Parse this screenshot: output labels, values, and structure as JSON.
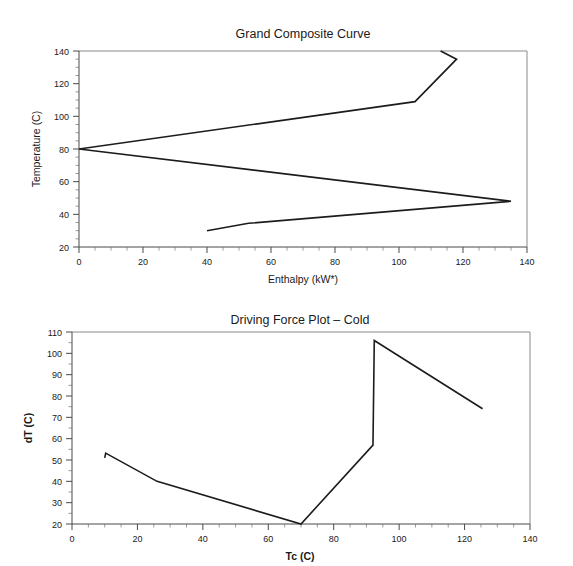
{
  "document": {
    "background_color": "#ffffff",
    "line_color": "#1c1c1c",
    "axis_color": "#4a4a4a",
    "text_color": "#1a1a1a"
  },
  "charts": [
    {
      "id": "grand-composite-curve",
      "title": "Grand Composite Curve",
      "xlabel": "Enthalpy (kW*)",
      "ylabel": "Temperature (C)",
      "xlabel_bold": false,
      "ylabel_bold": false,
      "xticks": [
        "0",
        "20",
        "40",
        "60",
        "80",
        "100",
        "120",
        "140"
      ],
      "yticks": [
        "20",
        "40",
        "60",
        "80",
        "100",
        "120",
        "140"
      ]
    },
    {
      "id": "driving-force-plot-cold",
      "title": "Driving Force Plot – Cold",
      "xlabel": "Tc (C)",
      "ylabel": "dT (C)",
      "xlabel_bold": true,
      "ylabel_bold": true,
      "xticks": [
        "0",
        "20",
        "40",
        "60",
        "80",
        "100",
        "120",
        "140"
      ],
      "yticks": [
        "20",
        "30",
        "40",
        "50",
        "60",
        "70",
        "80",
        "90",
        "100",
        "110"
      ]
    }
  ],
  "chart_data": [
    {
      "type": "line",
      "id": "grand-composite-curve",
      "title": "Grand Composite Curve",
      "xlabel": "Enthalpy (kW*)",
      "ylabel": "Temperature (C)",
      "xlim": [
        0,
        140
      ],
      "ylim": [
        20,
        140
      ],
      "xticks": [
        0,
        20,
        40,
        60,
        80,
        100,
        120,
        140
      ],
      "yticks": [
        20,
        40,
        60,
        80,
        100,
        120,
        140
      ],
      "x_minor_tick_step": 5,
      "y_minor_tick_step": 5,
      "grid": false,
      "legend": "none",
      "series": [
        {
          "name": "Grand Composite Curve",
          "x": [
            40.0,
            53.0,
            135.0,
            0.0,
            105.0,
            118.0,
            113.0
          ],
          "y": [
            30.0,
            34.5,
            48.0,
            80.0,
            109.0,
            135.0,
            140.0
          ]
        }
      ]
    },
    {
      "type": "line",
      "id": "driving-force-plot-cold",
      "title": "Driving Force Plot – Cold",
      "xlabel": "Tc (C)",
      "ylabel": "dT (C)",
      "xlim": [
        0,
        140
      ],
      "ylim": [
        20,
        110
      ],
      "xticks": [
        0,
        20,
        40,
        60,
        80,
        100,
        120,
        140
      ],
      "yticks": [
        20,
        30,
        40,
        50,
        60,
        70,
        80,
        90,
        100,
        110
      ],
      "x_minor_tick_step": 5,
      "y_minor_tick_step": 2.5,
      "grid": false,
      "legend": "none",
      "series": [
        {
          "name": "Driving Force – Cold",
          "x": [
            10.0,
            10.3,
            26.0,
            70.0,
            92.0,
            92.4,
            125.5
          ],
          "y": [
            51.0,
            53.2,
            40.0,
            20.0,
            57.0,
            106.0,
            74.0
          ]
        }
      ]
    }
  ]
}
